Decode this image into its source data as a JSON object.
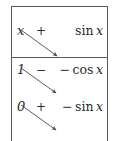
{
  "figure": {
    "kind": "tabular-integration-table",
    "colors": {
      "rule": "#555a5e",
      "text": "#2b2b2b",
      "arrow": "#4a4a4a",
      "background": "#ffffff"
    }
  },
  "table": {
    "columns": [
      "u-column",
      "sign-column",
      "dv-column"
    ],
    "rows": [
      {
        "u": "x",
        "sign": "+",
        "dv_prefix": "",
        "dv_fn": "sin",
        "dv_arg": "x",
        "dv": "sin x"
      },
      {
        "u": "1",
        "sign": "−",
        "dv_prefix": "−",
        "dv_fn": "cos",
        "dv_arg": "x",
        "dv": "− cos x"
      },
      {
        "u": "0",
        "sign": "+",
        "dv_prefix": "−",
        "dv_fn": "sin",
        "dv_arg": "x",
        "dv": "− sin x"
      }
    ]
  },
  "arrows": [
    {
      "name": "arrow-row0-to-row1",
      "x1": 21,
      "y1": 30,
      "x2": 57,
      "y2": 56
    },
    {
      "name": "arrow-row1-to-row2",
      "x1": 21,
      "y1": 68,
      "x2": 56,
      "y2": 93
    },
    {
      "name": "arrow-row2-to-row3",
      "x1": 21,
      "y1": 105,
      "x2": 56,
      "y2": 130
    }
  ]
}
